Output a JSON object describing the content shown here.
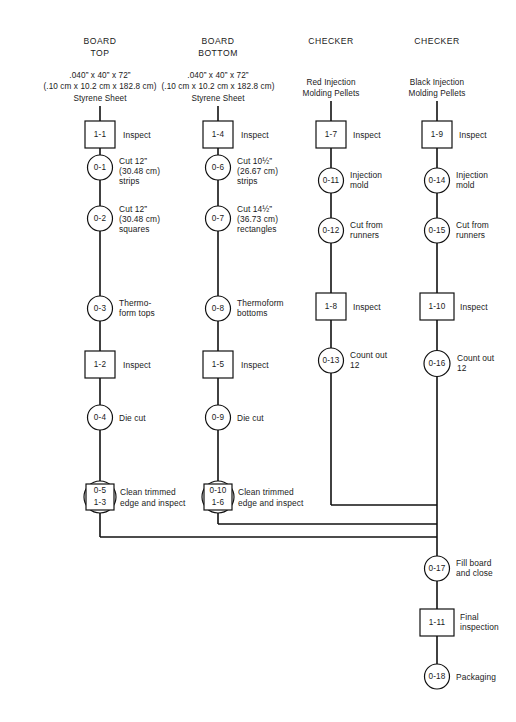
{
  "diagram": {
    "columns": [
      {
        "id": "board-top",
        "heading_line1": "BOARD",
        "heading_line2": "TOP",
        "material_line1": ".040” x 40” x 72”",
        "material_line2": "(.10 cm x 10.2 cm x 182.8 cm)",
        "material_line3": "Styrene Sheet"
      },
      {
        "id": "board-bottom",
        "heading_line1": "BOARD",
        "heading_line2": "BOTTOM",
        "material_line1": ".040” x 40” x 72”",
        "material_line2": "(.10 cm x 10.2 cm x 182.8 cm)",
        "material_line3": "Styrene Sheet"
      },
      {
        "id": "checker-red",
        "heading_line1": "CHECKER",
        "heading_line2": "",
        "material_line1": "Red Injection",
        "material_line2": "Molding Pellets",
        "material_line3": ""
      },
      {
        "id": "checker-black",
        "heading_line1": "CHECKER",
        "heading_line2": "",
        "material_line1": "Black Injection",
        "material_line2": "Molding Pellets",
        "material_line3": ""
      }
    ],
    "nodes": [
      {
        "key": "n1_1",
        "id": "1-1",
        "shape": "square",
        "label_lines": [
          "Inspect"
        ]
      },
      {
        "key": "n0_1",
        "id": "0-1",
        "shape": "circle",
        "label_lines": [
          "Cut 12”",
          "(30.48 cm)",
          "strips"
        ]
      },
      {
        "key": "n0_2",
        "id": "0-2",
        "shape": "circle",
        "label_lines": [
          "Cut 12”",
          "(30.48 cm)",
          "squares"
        ]
      },
      {
        "key": "n0_3",
        "id": "0-3",
        "shape": "circle",
        "label_lines": [
          "Thermo-",
          "form tops"
        ]
      },
      {
        "key": "n1_2",
        "id": "1-2",
        "shape": "square",
        "label_lines": [
          "Inspect"
        ]
      },
      {
        "key": "n0_4",
        "id": "0-4",
        "shape": "circle",
        "label_lines": [
          "Die cut"
        ]
      },
      {
        "key": "n0_5",
        "id": "0-5",
        "id2": "1-3",
        "shape": "combined",
        "label_lines": [
          "Clean trimmed",
          "edge and inspect"
        ]
      },
      {
        "key": "n1_4",
        "id": "1-4",
        "shape": "square",
        "label_lines": [
          "Inspect"
        ]
      },
      {
        "key": "n0_6",
        "id": "0-6",
        "shape": "circle",
        "label_lines": [
          "Cut 10½”",
          "(26.67 cm)",
          "strips"
        ]
      },
      {
        "key": "n0_7",
        "id": "0-7",
        "shape": "circle",
        "label_lines": [
          "Cut 14½”",
          "(36.73 cm)",
          "rectangles"
        ]
      },
      {
        "key": "n0_8",
        "id": "0-8",
        "shape": "circle",
        "label_lines": [
          "Thermoform",
          "bottoms"
        ]
      },
      {
        "key": "n1_5",
        "id": "1-5",
        "shape": "square",
        "label_lines": [
          "Inspect"
        ]
      },
      {
        "key": "n0_9",
        "id": "0-9",
        "shape": "circle",
        "label_lines": [
          "Die cut"
        ]
      },
      {
        "key": "n0_10",
        "id": "0-10",
        "id2": "1-6",
        "shape": "combined",
        "label_lines": [
          "Clean trimmed",
          "edge and inspect"
        ]
      },
      {
        "key": "n1_7",
        "id": "1-7",
        "shape": "square",
        "label_lines": [
          "Inspect"
        ]
      },
      {
        "key": "n0_11",
        "id": "0-11",
        "shape": "circle",
        "label_lines": [
          "Injection",
          "mold"
        ]
      },
      {
        "key": "n0_12",
        "id": "0-12",
        "shape": "circle",
        "label_lines": [
          "Cut from",
          "runners"
        ]
      },
      {
        "key": "n1_8",
        "id": "1-8",
        "shape": "square",
        "label_lines": [
          "Inspect"
        ]
      },
      {
        "key": "n0_13",
        "id": "0-13",
        "shape": "circle",
        "label_lines": [
          "Count out",
          "12"
        ]
      },
      {
        "key": "n1_9",
        "id": "1-9",
        "shape": "square",
        "label_lines": [
          "Inspect"
        ]
      },
      {
        "key": "n0_14",
        "id": "0-14",
        "shape": "circle",
        "label_lines": [
          "Injection",
          "mold"
        ]
      },
      {
        "key": "n0_15",
        "id": "0-15",
        "shape": "circle",
        "label_lines": [
          "Cut from",
          "runners"
        ]
      },
      {
        "key": "n1_10",
        "id": "1-10",
        "shape": "square",
        "label_lines": [
          "Inspect"
        ]
      },
      {
        "key": "n0_16",
        "id": "0-16",
        "shape": "circle",
        "label_lines": [
          "Count out",
          "12"
        ]
      },
      {
        "key": "n0_17",
        "id": "0-17",
        "shape": "circle",
        "label_lines": [
          "Fill board",
          "and close"
        ]
      },
      {
        "key": "n1_11",
        "id": "1-11",
        "shape": "square",
        "label_lines": [
          "Final",
          "inspection"
        ]
      },
      {
        "key": "n0_18",
        "id": "0-18",
        "shape": "circle",
        "label_lines": [
          "Packaging"
        ]
      }
    ],
    "colors": {
      "ink": "#111111",
      "paper": "#ffffff"
    }
  }
}
